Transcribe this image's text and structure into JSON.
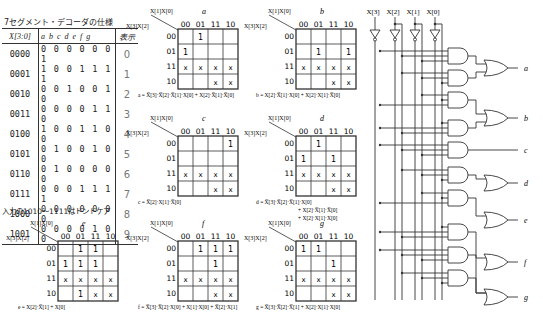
{
  "spec_table": {
    "title": "7セグメント・デコーダの仕様",
    "headers": {
      "input": "X[3:0]",
      "outputs": [
        "a",
        "b",
        "c",
        "d",
        "e",
        "f",
        "g"
      ],
      "display": "表示"
    },
    "rows": [
      {
        "input": "0000",
        "out": "0000001",
        "disp": "0"
      },
      {
        "input": "0001",
        "out": "1001111",
        "disp": "1"
      },
      {
        "input": "0010",
        "out": "0010010",
        "disp": "2"
      },
      {
        "input": "0011",
        "out": "0000110",
        "disp": "3"
      },
      {
        "input": "0100",
        "out": "1001100",
        "disp": "4"
      },
      {
        "input": "0101",
        "out": "0100100",
        "disp": "5"
      },
      {
        "input": "0110",
        "out": "0100000",
        "disp": "6"
      },
      {
        "input": "0111",
        "out": "0001111",
        "disp": "7"
      },
      {
        "input": "1000",
        "out": "0000000",
        "disp": "8"
      },
      {
        "input": "1001",
        "out": "0000100",
        "disp": "9"
      }
    ],
    "note": "入力の1010～1111はドントケア"
  },
  "kmaps": {
    "col_var": "X[1]X[0]",
    "row_var": "X[3]X[2]",
    "col_labels": [
      "00",
      "01",
      "11",
      "10"
    ],
    "row_labels": [
      "00",
      "01",
      "11",
      "10"
    ],
    "maps": [
      {
        "name": "a",
        "cells": [
          [
            "",
            "1",
            "",
            ""
          ],
          [
            "1",
            "",
            "",
            ""
          ],
          [
            "x",
            "x",
            "x",
            "x"
          ],
          [
            "",
            "",
            "x",
            "x"
          ]
        ],
        "eq": "a = X̅[3]·X̅[2]·X̅[1]·X[0] + X[2]·X̅[1]·X̅[0]"
      },
      {
        "name": "b",
        "cells": [
          [
            "",
            "",
            "",
            ""
          ],
          [
            "",
            "1",
            "",
            "1"
          ],
          [
            "x",
            "x",
            "x",
            "x"
          ],
          [
            "",
            "",
            "x",
            "x"
          ]
        ],
        "eq": "b = X[2]·X̅[1]·X[0] + X[2]·X[1]·X̅[0]"
      },
      {
        "name": "c",
        "cells": [
          [
            "",
            "",
            "",
            "1"
          ],
          [
            "",
            "",
            "",
            ""
          ],
          [
            "x",
            "x",
            "x",
            "x"
          ],
          [
            "",
            "",
            "x",
            "x"
          ]
        ],
        "eq": "c = X̅[2]·X[1]·X̅[0]"
      },
      {
        "name": "d",
        "cells": [
          [
            "",
            "1",
            "",
            ""
          ],
          [
            "1",
            "",
            "1",
            ""
          ],
          [
            "x",
            "x",
            "x",
            "x"
          ],
          [
            "",
            "",
            "x",
            "x"
          ]
        ],
        "eq": [
          "d = X̅[3]·X̅[2]·X̅[1]·X[0]",
          "+ X[2]·X̅[1]·X̅[0]",
          "+ X[2]·X[1]·X[0]"
        ]
      },
      {
        "name": "e",
        "cells": [
          [
            "",
            "1",
            "1",
            ""
          ],
          [
            "1",
            "1",
            "1",
            ""
          ],
          [
            "x",
            "x",
            "x",
            "x"
          ],
          [
            "",
            "1",
            "x",
            "x"
          ]
        ],
        "eq": "e = X[2]·X̅[1] + X[0]"
      },
      {
        "name": "f",
        "cells": [
          [
            "",
            "1",
            "1",
            "1"
          ],
          [
            "",
            "",
            "1",
            ""
          ],
          [
            "x",
            "x",
            "x",
            "x"
          ],
          [
            "",
            "",
            "x",
            "x"
          ]
        ],
        "eq": "f = X̅[3]·X̅[2]·X[0] + X[1]·X[0] + X̅[2]·X[1]"
      },
      {
        "name": "g",
        "cells": [
          [
            "1",
            "1",
            "",
            ""
          ],
          [
            "",
            "",
            "1",
            ""
          ],
          [
            "x",
            "x",
            "x",
            "x"
          ],
          [
            "",
            "",
            "x",
            "x"
          ]
        ],
        "eq": "g = X̅[3]·X̅[2]·X̅[1] + X[2]·X[1]·X[0]"
      }
    ]
  },
  "circuit": {
    "inputs": [
      "X[3]",
      "X[2]",
      "X[1]",
      "X[0]"
    ],
    "outputs": [
      "a",
      "b",
      "c",
      "d",
      "e",
      "f",
      "g"
    ]
  }
}
